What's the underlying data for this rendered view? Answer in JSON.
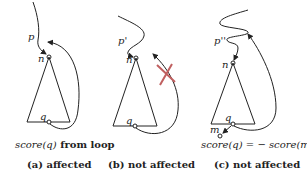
{
  "panels": [
    {
      "id": "a",
      "node_labels": {
        "top": "p",
        "root": "n",
        "leaf": "q"
      },
      "annotation": {
        "italic_part": "score(q)",
        "bold_part": " from loop"
      },
      "caption": "(a) affected"
    },
    {
      "id": "b",
      "node_labels": {
        "top": "p'",
        "root": "n",
        "leaf": "q"
      },
      "annotation": null,
      "caption": "(b) not affected",
      "blocked_marker": "x-cross"
    },
    {
      "id": "c",
      "node_labels": {
        "top": "p''",
        "root": "n",
        "leaf": "q",
        "child": "m"
      },
      "annotation": {
        "text": "score(q) = − score(m)"
      },
      "caption": "(c) not affected"
    }
  ],
  "colors": {
    "ink": "#222222",
    "accent_x": "#c06060"
  }
}
